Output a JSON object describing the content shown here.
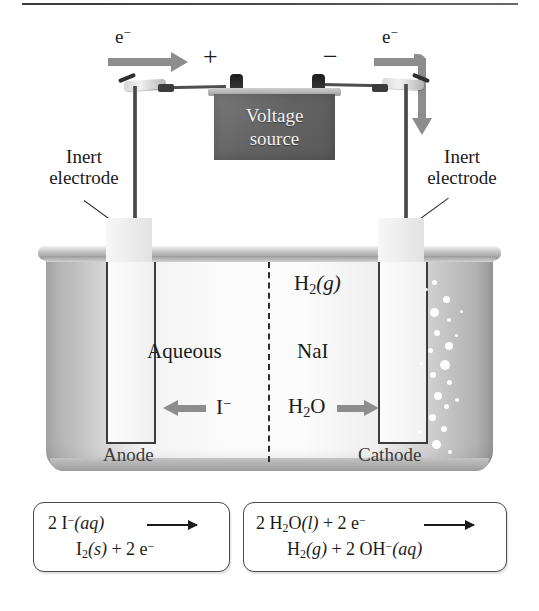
{
  "figure": {
    "type": "electrolytic-cell-diagram"
  },
  "circuit": {
    "electron_label_left": "e",
    "electron_label_right": "e",
    "electron_charge": "−",
    "terminal_positive": "+",
    "terminal_negative": "−",
    "voltage_source_line1": "Voltage",
    "voltage_source_line2": "source"
  },
  "labels": {
    "inert_electrode_left_line1": "Inert",
    "inert_electrode_left_line2": "electrode",
    "inert_electrode_right_line1": "Inert",
    "inert_electrode_right_line2": "electrode",
    "anode": "Anode",
    "cathode": "Cathode"
  },
  "solution": {
    "phase_label": "Aqueous",
    "solute_label": "NaI",
    "gas_formula": "H",
    "gas_sub": "2",
    "gas_state": "(g)",
    "water_formula": "H",
    "water_sub": "2",
    "water_rest": "O",
    "iodide_symbol": "I",
    "iodide_charge": "−"
  },
  "equations": {
    "anode": {
      "reactant_coeff": "2",
      "reactant": "I",
      "reactant_charge": "−",
      "reactant_state": "(aq)",
      "product_line": "I",
      "product_sub": "2",
      "product_state": "(s)",
      "plus": "+",
      "electron_coeff": "2",
      "electron": "e",
      "electron_charge": "−"
    },
    "cathode": {
      "reactant_coeff": "2",
      "reactant": "H",
      "reactant_sub": "2",
      "reactant_rest": "O",
      "reactant_state": "(l)",
      "plus1": "+",
      "electron_coeff": "2",
      "electron": "e",
      "electron_charge": "−",
      "product": "H",
      "product_sub": "2",
      "product_state": "(g)",
      "plus2": "+",
      "hydroxide_coeff": "2",
      "hydroxide": "OH",
      "hydroxide_charge": "−",
      "hydroxide_state": "(aq)"
    }
  },
  "colors": {
    "arrow_gray": "#8d8d8d",
    "voltage_source": "#646464",
    "text": "#1b1b1b",
    "beaker_light": "#fbfbfb",
    "beaker_edge": "#adadad",
    "electrode_outline": "#3d3d3d"
  }
}
